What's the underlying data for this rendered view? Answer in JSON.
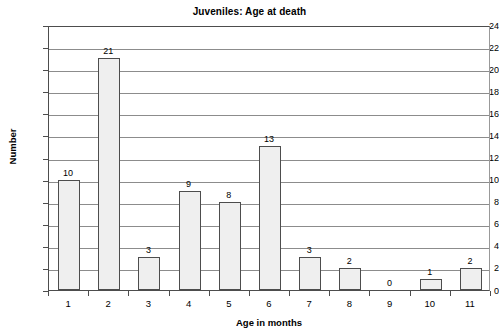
{
  "chart_data": {
    "type": "bar",
    "title": "Juveniles: Age at death",
    "xlabel": "Age in months",
    "ylabel": "Number",
    "categories": [
      "1",
      "2",
      "3",
      "4",
      "5",
      "6",
      "7",
      "8",
      "9",
      "10",
      "11"
    ],
    "values": [
      10,
      21,
      3,
      9,
      8,
      13,
      3,
      2,
      0,
      1,
      2
    ],
    "data_labels": [
      "10",
      "21",
      "3",
      "9",
      "8",
      "13",
      "3",
      "2",
      "0",
      "1",
      "2"
    ],
    "ylim": [
      0,
      24
    ],
    "ytick_step": 2,
    "ytick_labels": [
      "0",
      "2",
      "4",
      "6",
      "8",
      "10",
      "12",
      "14",
      "16",
      "18",
      "20",
      "22",
      "24"
    ],
    "grid": "horizontal",
    "legend": "none",
    "bar_fill_color": "#efefef",
    "bar_border_color": "#4d4d4d",
    "gridline_color": "#8c8c8c",
    "axis_color": "#4d4d4d",
    "background_color": "#ffffff"
  }
}
